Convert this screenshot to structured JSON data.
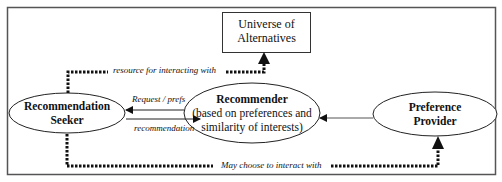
{
  "diagram": {
    "nodes": {
      "universe": {
        "line1": "Universe of",
        "line2": "Alternatives",
        "shape": "rectangle"
      },
      "seeker": {
        "line1": "Recommendation",
        "line2": "Seeker",
        "shape": "ellipse"
      },
      "recommender": {
        "line1": "Recommender",
        "line2": "(based on preferences and",
        "line3": "similarity of interests)",
        "shape": "ellipse"
      },
      "provider": {
        "line1": "Preference",
        "line2": "Provider",
        "shape": "ellipse"
      }
    },
    "edges": {
      "resource": {
        "label": "resource for interacting with",
        "from": "seeker",
        "to": "universe",
        "style": "dotted"
      },
      "request": {
        "label": "Request / prefs",
        "from": "seeker",
        "to": "recommender",
        "style": "solid"
      },
      "recommendation": {
        "label": "recommendation",
        "from": "recommender",
        "to": "seeker",
        "style": "solid"
      },
      "provider_to_recommender": {
        "label": "",
        "from": "provider",
        "to": "recommender",
        "style": "solid"
      },
      "may_choose": {
        "label": "May choose to interact with",
        "from": "seeker",
        "to": "provider",
        "style": "dotted"
      }
    },
    "colors": {
      "stroke": "#111111",
      "frame": "#555555",
      "background": "#ffffff"
    }
  }
}
